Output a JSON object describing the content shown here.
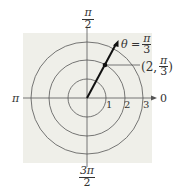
{
  "diagram": {
    "type": "polar-coordinate-plot",
    "background_color": "#efefe9",
    "line_color": "#555555",
    "ray_color": "#111111",
    "circles": [
      1,
      2,
      3
    ],
    "circle_labels": [
      "1",
      "2",
      "3"
    ],
    "axis_labels": {
      "right": "0",
      "top": {
        "num": "π",
        "den": "2"
      },
      "left": "π",
      "bottom": {
        "num": "3π",
        "den": "2"
      }
    },
    "ray": {
      "angle_label": {
        "prefix": "θ =",
        "num": "π",
        "den": "3"
      }
    },
    "point": {
      "r": 2,
      "theta": "π/3",
      "label": {
        "open": "(2,",
        "num": "π",
        "den": "3",
        "close": ")"
      }
    }
  }
}
